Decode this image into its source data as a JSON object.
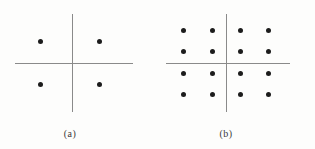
{
  "figure": {
    "background_color": "#fdfdfc",
    "axis_color": "#8a8a8a",
    "dot_color": "#1c1c1c",
    "caption_color": "#3a3a3a",
    "panels": [
      {
        "id": "a",
        "caption": "(a)",
        "caption_x": 70,
        "caption_y": 128,
        "axis_h": {
          "x1": 15,
          "x2": 133,
          "y": 63
        },
        "axis_v": {
          "y1": 14,
          "y2": 112,
          "x": 72
        },
        "origin": {
          "x": 72,
          "y": 63
        },
        "dot_count": 4,
        "grid": {
          "columns": 2,
          "rows": 2
        },
        "dots": [
          {
            "x": 40,
            "y": 41
          },
          {
            "x": 99,
            "y": 41
          },
          {
            "x": 40,
            "y": 84
          },
          {
            "x": 99,
            "y": 84
          }
        ]
      },
      {
        "id": "b",
        "caption": "(b)",
        "caption_x": 226,
        "caption_y": 128,
        "axis_h": {
          "x1": 166,
          "x2": 290,
          "y": 63
        },
        "axis_v": {
          "y1": 14,
          "y2": 112,
          "x": 226
        },
        "origin": {
          "x": 226,
          "y": 63
        },
        "dot_count": 16,
        "grid": {
          "columns": 4,
          "rows": 4
        },
        "dots": [
          {
            "x": 183,
            "y": 30
          },
          {
            "x": 212,
            "y": 30
          },
          {
            "x": 240,
            "y": 30
          },
          {
            "x": 268,
            "y": 30
          },
          {
            "x": 183,
            "y": 51
          },
          {
            "x": 212,
            "y": 51
          },
          {
            "x": 240,
            "y": 51
          },
          {
            "x": 268,
            "y": 51
          },
          {
            "x": 183,
            "y": 73
          },
          {
            "x": 212,
            "y": 73
          },
          {
            "x": 240,
            "y": 73
          },
          {
            "x": 268,
            "y": 73
          },
          {
            "x": 183,
            "y": 94
          },
          {
            "x": 212,
            "y": 94
          },
          {
            "x": 240,
            "y": 94
          },
          {
            "x": 268,
            "y": 94
          }
        ]
      }
    ]
  }
}
